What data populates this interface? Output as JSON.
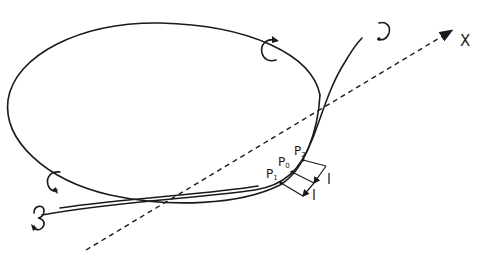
{
  "diagram": {
    "axis": {
      "label": "X",
      "style": "dashed",
      "direction": "upper-right"
    },
    "points": [
      {
        "name": "P",
        "subscript": "1"
      },
      {
        "name": "P",
        "subscript": "0"
      },
      {
        "name": "P",
        "subscript": "2"
      }
    ],
    "segment_labels": [
      "l",
      "l"
    ],
    "rotation_markers": [
      {
        "location": "ellipse-top",
        "glyph": "curl"
      },
      {
        "location": "ellipse-lower-left",
        "glyph": "curl"
      },
      {
        "location": "open-curve-top-end",
        "glyph": "curl"
      },
      {
        "location": "open-curve-left-end",
        "glyph": "curl"
      }
    ],
    "colors": {
      "ink": "#1a1a1a",
      "background": "#ffffff"
    }
  }
}
